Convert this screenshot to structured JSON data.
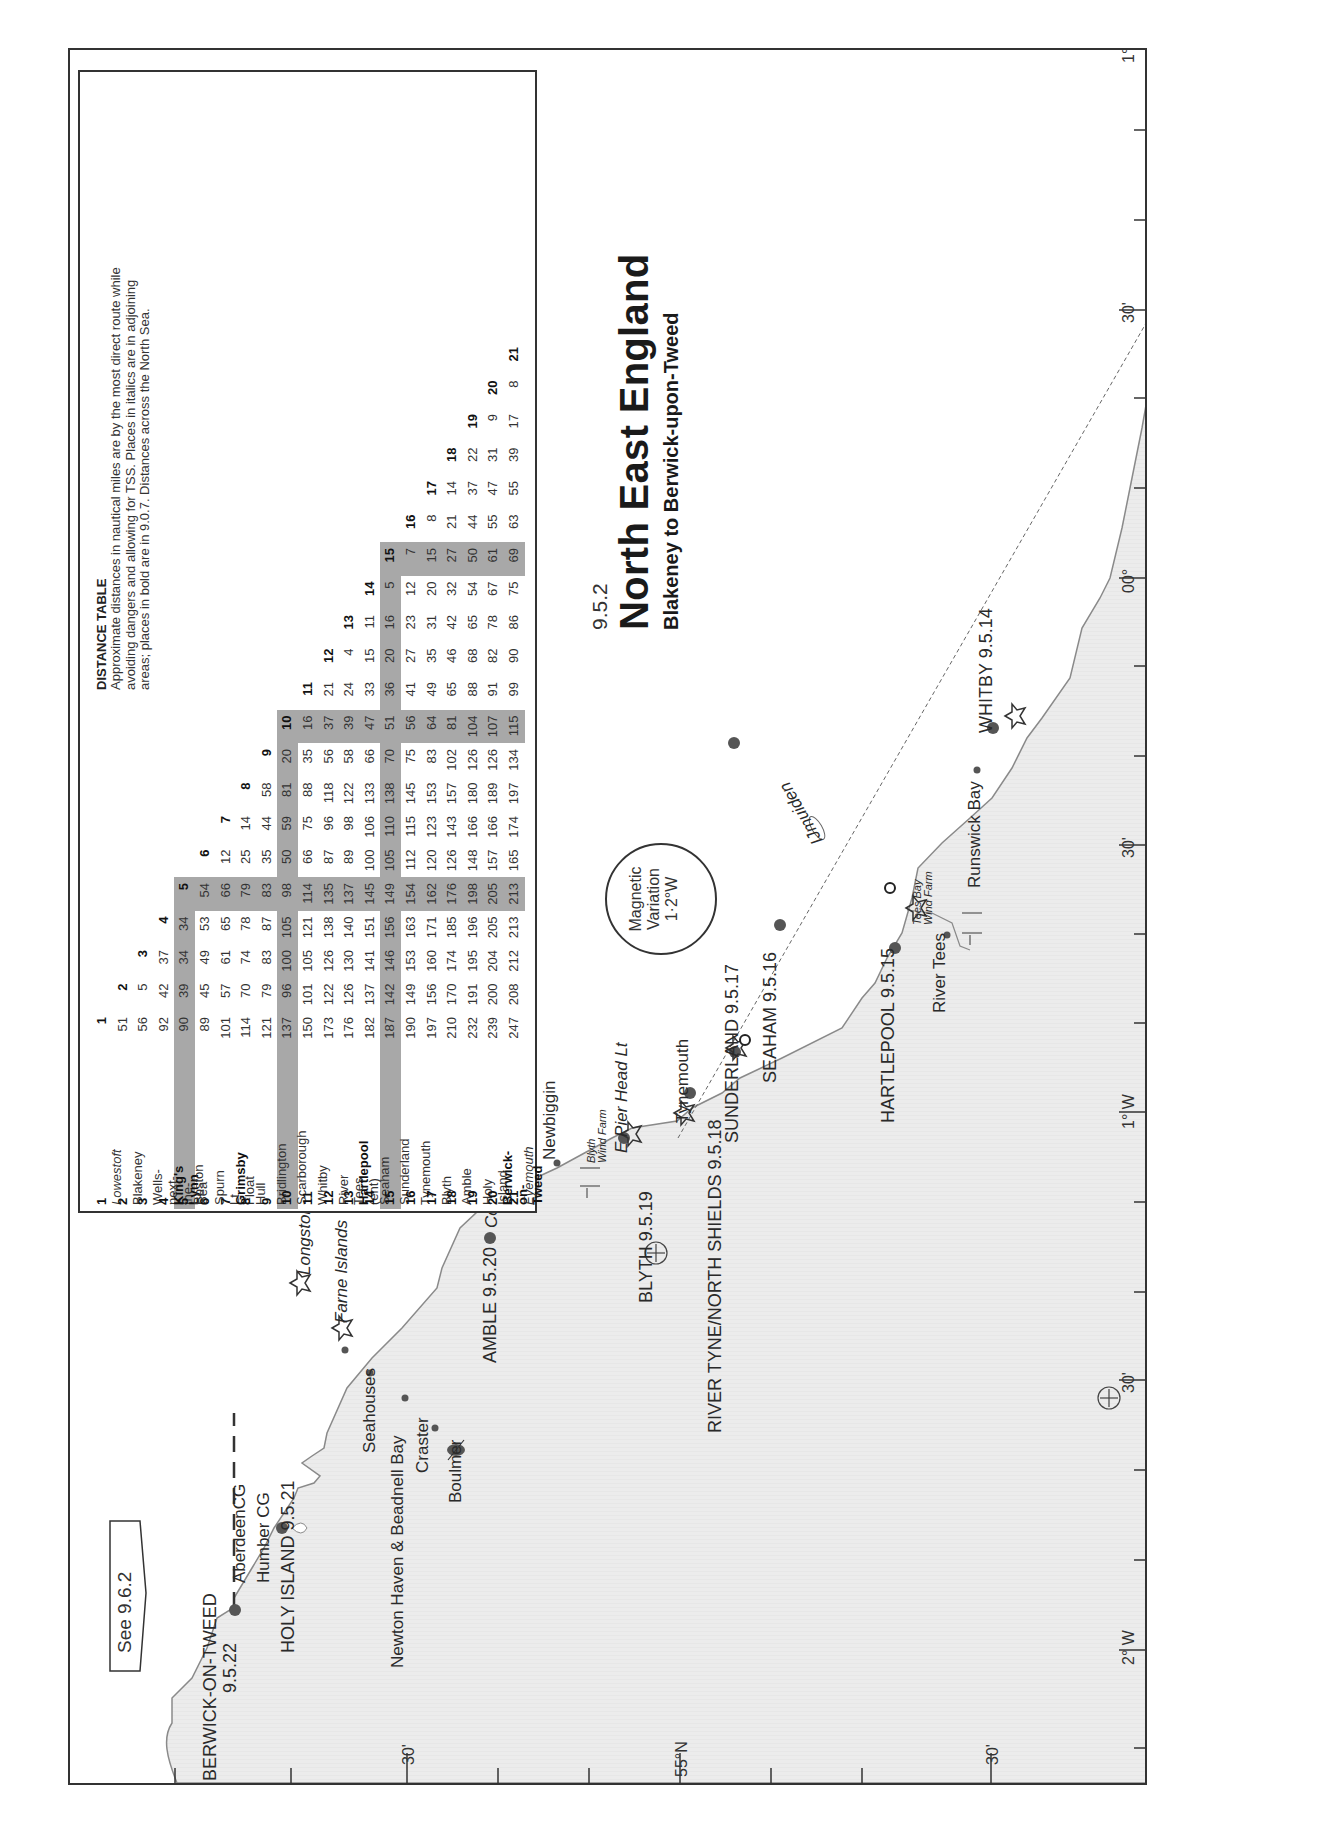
{
  "header": {
    "section_number": "9.5.2",
    "title": "North East England",
    "subtitle": "Blakeney to Berwick-upon-Tweed"
  },
  "distance_table": {
    "title": "DISTANCE TABLE",
    "description": "Approximate distances in nautical miles are by the most direct route while avoiding dangers and allowing for TSS. Places in italics are in adjoining areas; places in bold are in 9.0.7. Distances across the North Sea.",
    "places": [
      {
        "num": "1",
        "name": "Lowestoft",
        "style": "italic"
      },
      {
        "num": "2",
        "name": "Blakeney",
        "style": "normal"
      },
      {
        "num": "3",
        "name": "Wells-next-the-Sea",
        "style": "normal"
      },
      {
        "num": "4",
        "name": "King's Lynn",
        "style": "bold"
      },
      {
        "num": "5",
        "name": "Boston",
        "style": "shaded"
      },
      {
        "num": "6",
        "name": "Spurn Lt Float",
        "style": "normal"
      },
      {
        "num": "7",
        "name": "Grimsby",
        "style": "bold"
      },
      {
        "num": "8",
        "name": "Hull",
        "style": "normal"
      },
      {
        "num": "9",
        "name": "Bridlington",
        "style": "normal"
      },
      {
        "num": "10",
        "name": "Scarborough",
        "style": "shaded"
      },
      {
        "num": "11",
        "name": "Whitby",
        "style": "normal"
      },
      {
        "num": "12",
        "name": "River Tees (ent)",
        "style": "normal"
      },
      {
        "num": "13",
        "name": "Hartlepool",
        "style": "bold"
      },
      {
        "num": "14",
        "name": "Seaham",
        "style": "normal"
      },
      {
        "num": "15",
        "name": "Sunderland",
        "style": "shaded"
      },
      {
        "num": "16",
        "name": "Tynemouth",
        "style": "normal"
      },
      {
        "num": "17",
        "name": "Blyth",
        "style": "normal"
      },
      {
        "num": "18",
        "name": "Amble",
        "style": "normal"
      },
      {
        "num": "19",
        "name": "Holy Island",
        "style": "normal"
      },
      {
        "num": "20",
        "name": "Berwick-on-Tweed",
        "style": "bold"
      },
      {
        "num": "21",
        "name": "Eyemouth",
        "style": "italic"
      }
    ],
    "rows": [
      [
        "1"
      ],
      [
        "51",
        "2"
      ],
      [
        "56",
        "5",
        "3"
      ],
      [
        "92",
        "42",
        "37",
        "4"
      ],
      [
        "90",
        "39",
        "34",
        "34",
        "5"
      ],
      [
        "89",
        "45",
        "49",
        "53",
        "54",
        "6"
      ],
      [
        "101",
        "57",
        "61",
        "65",
        "66",
        "12",
        "7"
      ],
      [
        "114",
        "70",
        "74",
        "78",
        "79",
        "25",
        "14",
        "8"
      ],
      [
        "121",
        "79",
        "83",
        "87",
        "83",
        "35",
        "44",
        "58",
        "9"
      ],
      [
        "137",
        "96",
        "100",
        "105",
        "98",
        "50",
        "59",
        "81",
        "20",
        "10"
      ],
      [
        "150",
        "101",
        "105",
        "121",
        "114",
        "66",
        "75",
        "88",
        "35",
        "16",
        "11"
      ],
      [
        "173",
        "122",
        "126",
        "138",
        "135",
        "87",
        "96",
        "118",
        "56",
        "37",
        "21",
        "12"
      ],
      [
        "176",
        "126",
        "130",
        "140",
        "137",
        "89",
        "98",
        "122",
        "58",
        "39",
        "24",
        "4",
        "13"
      ],
      [
        "182",
        "137",
        "141",
        "151",
        "145",
        "100",
        "106",
        "133",
        "66",
        "47",
        "33",
        "15",
        "11",
        "14"
      ],
      [
        "187",
        "142",
        "146",
        "156",
        "149",
        "105",
        "110",
        "138",
        "70",
        "51",
        "36",
        "20",
        "16",
        "5",
        "15"
      ],
      [
        "190",
        "149",
        "153",
        "163",
        "154",
        "112",
        "115",
        "145",
        "75",
        "56",
        "41",
        "27",
        "23",
        "12",
        "7",
        "16"
      ],
      [
        "197",
        "156",
        "160",
        "171",
        "162",
        "120",
        "123",
        "153",
        "83",
        "64",
        "49",
        "35",
        "31",
        "20",
        "15",
        "8",
        "17"
      ],
      [
        "210",
        "170",
        "174",
        "185",
        "176",
        "126",
        "143",
        "157",
        "102",
        "81",
        "65",
        "46",
        "42",
        "32",
        "27",
        "21",
        "14",
        "18"
      ],
      [
        "232",
        "191",
        "195",
        "196",
        "198",
        "148",
        "166",
        "180",
        "126",
        "104",
        "88",
        "68",
        "65",
        "54",
        "50",
        "44",
        "37",
        "22",
        "19"
      ],
      [
        "239",
        "200",
        "204",
        "205",
        "205",
        "157",
        "166",
        "189",
        "126",
        "107",
        "91",
        "82",
        "78",
        "67",
        "61",
        "55",
        "47",
        "31",
        "9",
        "20"
      ],
      [
        "247",
        "208",
        "212",
        "213",
        "213",
        "165",
        "174",
        "197",
        "134",
        "115",
        "99",
        "90",
        "86",
        "75",
        "69",
        "63",
        "55",
        "39",
        "17",
        "8",
        "21"
      ]
    ],
    "shaded_indices": [
      5,
      10,
      15
    ]
  },
  "magnetic_variation": {
    "line1": "Magnetic",
    "line2": "Variation",
    "value": "1·2°W"
  },
  "see_reference": "See 9.6.2",
  "map_labels": {
    "berwick": "BERWICK-ON-TWEED",
    "berwick_ref": "9.5.22",
    "holy_island": "HOLY ISLAND 9.5.21",
    "aberdeen_cg": "AberdeenCG",
    "humber_cg": "Humber CG",
    "longstone": "Longstone",
    "farne_islands": "Farne Islands",
    "seahouses": "Seahouses",
    "newton_haven": "Newton Haven & Beadnell Bay",
    "craster": "Craster",
    "boulmer": "Boulmer",
    "amble": "AMBLE 9.5.20",
    "coquet_island": "Coquet Island",
    "newbiggin": "Newbiggin",
    "blyth_wind_farm_1": "Blyth",
    "blyth_wind_farm_2": "Wind Farm",
    "e_pier_head": "E Pier Head Lt",
    "blyth": "BLYTH 9.5.19",
    "tynemouth": "Tynemouth",
    "river_tyne": "RIVER TYNE/NORTH SHIELDS 9.5.18",
    "sunderland": "SUNDERLAND 9.5.17",
    "seaham": "SEAHAM 9.5.16",
    "tees_bay_1": "Tees Bay",
    "tees_bay_2": "Wind Farm",
    "hartlepool": "HARTLEPOOL 9.5.15",
    "river_tees": "River Tees",
    "runswick_bay": "Runswick Bay",
    "whitby": "WHITBY 9.5.14",
    "ijmuiden": "IJmuiden"
  },
  "axis_labels": {
    "lat_30_top": "30'",
    "lat_55n": "55°N",
    "lat_30_bottom": "30'",
    "lon_2w": "2° W",
    "lon_30a": "30'",
    "lon_1w": "1° W",
    "lon_30b": "30'",
    "lon_00": "00°",
    "lon_30c": "30'",
    "lon_1e": "1° E",
    "lon_30d": "30'"
  },
  "colors": {
    "land": "#ececec",
    "coastline": "#8a8a8a",
    "shade_band": "#a8a8a8",
    "port_dot": "#555555",
    "frame": "#333333"
  }
}
